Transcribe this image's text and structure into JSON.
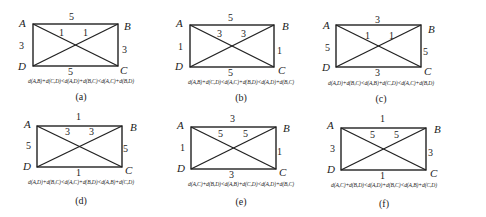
{
  "figure": {
    "panels": [
      {
        "id": "a",
        "label": "(a)",
        "vertices": {
          "A": "A",
          "B": "B",
          "C": "C",
          "D": "D"
        },
        "edges": {
          "AB": "5",
          "CD": "5",
          "AD": "3",
          "BC": "3",
          "AC": "1",
          "BD": "1"
        },
        "inequality": "d(A,B)+d(C,D)<d(A,D)+d(B,C)<d(A,C)+d(B,D)"
      },
      {
        "id": "b",
        "label": "(b)",
        "vertices": {
          "A": "A",
          "B": "B",
          "C": "C",
          "D": "D"
        },
        "edges": {
          "AB": "5",
          "CD": "5",
          "AD": "1",
          "BC": "1",
          "AC": "3",
          "BD": "3"
        },
        "inequality": "d(A,B)+d(C,D)<d(A,C)+d(B,D)<d(A,D)+d(B,C)"
      },
      {
        "id": "c",
        "label": "(c)",
        "vertices": {
          "A": "A",
          "B": "B",
          "C": "C",
          "D": "D"
        },
        "edges": {
          "AB": "3",
          "CD": "3",
          "AD": "5",
          "BC": "5",
          "AC": "1",
          "BD": "1"
        },
        "inequality": "d(A,D)+d(B,C)<d(A,B)+d(C,D)<d(A,C)+d(B,D)"
      },
      {
        "id": "d",
        "label": "(d)",
        "vertices": {
          "A": "A",
          "B": "B",
          "C": "C",
          "D": "D"
        },
        "edges": {
          "AB": "1",
          "CD": "1",
          "AD": "5",
          "BC": "5",
          "AC": "3",
          "BD": "3"
        },
        "inequality": "d(A,D)+d(B,C)<d(A,C)+d(B,D)<d(A,B)+d(C,D)"
      },
      {
        "id": "e",
        "label": "(e)",
        "vertices": {
          "A": "A",
          "B": "B",
          "C": "C",
          "D": "D"
        },
        "edges": {
          "AB": "3",
          "CD": "3",
          "AD": "1",
          "BC": "1",
          "AC": "5",
          "BD": "5"
        },
        "inequality": "d(A,C)+d(B,D)<d(A,B)+d(C,D)<d(A,D)+d(B,C)"
      },
      {
        "id": "f",
        "label": "(f)",
        "vertices": {
          "A": "A",
          "B": "B",
          "C": "C",
          "D": "D"
        },
        "edges": {
          "AB": "1",
          "CD": "1",
          "AD": "3",
          "BC": "3",
          "AC": "5",
          "BD": "5"
        },
        "inequality": "d(A,C)+d(B,D)<d(A,D)+d(B,C)<d(A,B)+d(C,D)"
      }
    ]
  }
}
